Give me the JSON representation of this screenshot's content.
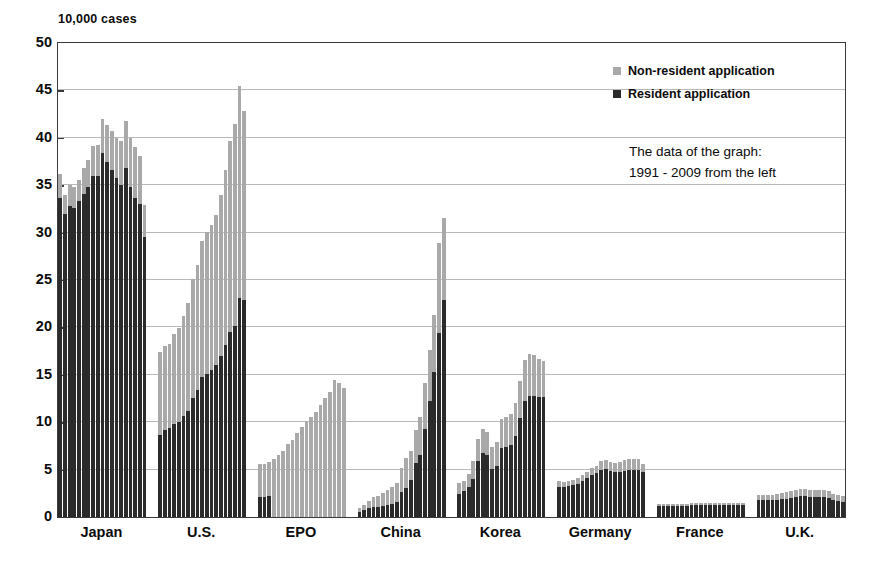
{
  "chart_data": {
    "type": "bar",
    "subtype": "stacked-grouped",
    "title": "",
    "unit_label": "10,000 cases",
    "xlabel": "",
    "ylabel": "",
    "ylim": [
      0,
      50
    ],
    "yticks": [
      0,
      5,
      10,
      15,
      20,
      25,
      30,
      35,
      40,
      45,
      50
    ],
    "grid": true,
    "legend_position": "upper-right-inside",
    "annotation": [
      "The data of the graph:",
      "1991 - 2009 from the left"
    ],
    "years": [
      1991,
      1992,
      1993,
      1994,
      1995,
      1996,
      1997,
      1998,
      1999,
      2000,
      2001,
      2002,
      2003,
      2004,
      2005,
      2006,
      2007,
      2008,
      2009
    ],
    "categories": [
      "Japan",
      "U.S.",
      "EPO",
      "China",
      "Korea",
      "Germany",
      "France",
      "U.K."
    ],
    "series": [
      {
        "name": "Resident application",
        "color": "#2b2b2b"
      },
      {
        "name": "Non-resident application",
        "color": "#a9a9a9"
      }
    ],
    "groups": [
      {
        "category": "Japan",
        "resident": [
          33.6,
          32.0,
          32.8,
          32.6,
          33.3,
          34.1,
          34.8,
          36.0,
          36.0,
          38.4,
          37.4,
          36.6,
          35.8,
          35.0,
          36.8,
          34.8,
          33.6,
          33.0,
          29.5
        ],
        "non_resident": [
          2.6,
          2.0,
          2.2,
          2.2,
          2.3,
          2.7,
          2.9,
          3.1,
          3.2,
          3.6,
          3.9,
          4.1,
          4.2,
          4.7,
          5.0,
          5.2,
          5.4,
          5.1,
          3.4
        ]
      },
      {
        "category": "U.S.",
        "resident": [
          8.7,
          9.2,
          9.4,
          9.8,
          10.0,
          10.7,
          11.2,
          12.6,
          13.4,
          14.8,
          15.1,
          15.5,
          16.0,
          17.0,
          18.1,
          19.5,
          20.1,
          23.1,
          22.9
        ],
        "non_resident": [
          8.7,
          8.8,
          8.9,
          9.5,
          9.9,
          10.5,
          11.4,
          12.5,
          13.2,
          14.3,
          15.0,
          15.3,
          15.9,
          17.0,
          18.5,
          20.2,
          21.4,
          22.4,
          19.9
        ]
      },
      {
        "category": "EPO",
        "resident": [
          2.1,
          2.1,
          2.2,
          0.0,
          0.0,
          0.0,
          0.0,
          0.0,
          0.0,
          0.0,
          0.0,
          0.0,
          0.0,
          0.0,
          0.0,
          0.0,
          0.0,
          0.0,
          0.0
        ],
        "non_resident": [
          3.5,
          3.5,
          3.6,
          6.1,
          6.5,
          7.0,
          7.7,
          8.1,
          8.9,
          9.5,
          10.1,
          10.5,
          11.1,
          11.8,
          12.6,
          13.2,
          14.5,
          14.1,
          13.6
        ]
      },
      {
        "category": "China",
        "resident": [
          0.5,
          0.7,
          0.9,
          1.1,
          1.1,
          1.2,
          1.3,
          1.4,
          1.6,
          2.6,
          3.1,
          3.9,
          5.7,
          6.5,
          9.3,
          12.2,
          15.3,
          19.4,
          22.9
        ],
        "non_resident": [
          0.4,
          0.6,
          0.8,
          1.0,
          1.1,
          1.3,
          1.6,
          1.8,
          2.0,
          2.6,
          3.1,
          3.1,
          3.5,
          4.1,
          4.8,
          5.4,
          6.0,
          9.5,
          8.6
        ]
      },
      {
        "category": "Korea",
        "resident": [
          2.4,
          2.7,
          3.2,
          4.0,
          5.9,
          6.8,
          6.5,
          5.1,
          5.4,
          7.3,
          7.4,
          7.6,
          8.5,
          10.4,
          12.2,
          12.8,
          12.8,
          12.7,
          12.7
        ],
        "non_resident": [
          1.2,
          1.1,
          1.3,
          1.9,
          2.3,
          2.5,
          2.5,
          2.3,
          2.5,
          3.0,
          3.1,
          3.3,
          3.5,
          4.0,
          4.4,
          4.4,
          4.3,
          4.0,
          3.8
        ]
      },
      {
        "category": "Germany",
        "resident": [
          3.2,
          3.2,
          3.3,
          3.4,
          3.5,
          3.8,
          4.1,
          4.4,
          4.6,
          5.0,
          5.1,
          4.9,
          4.8,
          4.8,
          4.9,
          5.0,
          5.0,
          5.0,
          4.7
        ],
        "non_resident": [
          0.6,
          0.5,
          0.5,
          0.5,
          0.6,
          0.6,
          0.7,
          0.8,
          0.8,
          0.9,
          0.9,
          0.9,
          0.9,
          1.0,
          1.1,
          1.1,
          1.1,
          1.1,
          0.9
        ]
      },
      {
        "category": "France",
        "resident": [
          1.2,
          1.2,
          1.2,
          1.2,
          1.2,
          1.2,
          1.2,
          1.3,
          1.3,
          1.3,
          1.3,
          1.3,
          1.3,
          1.3,
          1.3,
          1.3,
          1.3,
          1.3,
          1.3
        ],
        "non_resident": [
          0.2,
          0.2,
          0.2,
          0.2,
          0.2,
          0.2,
          0.2,
          0.2,
          0.2,
          0.2,
          0.2,
          0.2,
          0.2,
          0.2,
          0.2,
          0.2,
          0.2,
          0.2,
          0.2
        ]
      },
      {
        "category": "U.K.",
        "resident": [
          1.8,
          1.8,
          1.8,
          1.8,
          1.8,
          1.9,
          1.9,
          2.0,
          2.1,
          2.2,
          2.2,
          2.1,
          2.1,
          2.1,
          2.1,
          2.0,
          1.8,
          1.7,
          1.6
        ],
        "non_resident": [
          0.5,
          0.5,
          0.5,
          0.5,
          0.6,
          0.6,
          0.7,
          0.7,
          0.8,
          0.8,
          0.8,
          0.7,
          0.7,
          0.7,
          0.7,
          0.7,
          0.6,
          0.6,
          0.6
        ]
      }
    ]
  },
  "legend": {
    "items": [
      {
        "label": "Non-resident application",
        "swatch": "non"
      },
      {
        "label": "Resident application",
        "swatch": "res"
      }
    ]
  },
  "annotation": {
    "line1": "The data of the graph:",
    "line2": "1991 - 2009 from the left"
  },
  "axis": {
    "unit_label": "10,000 cases",
    "y_tick_labels": [
      "50",
      "45",
      "40",
      "35",
      "30",
      "25",
      "20",
      "15",
      "10",
      "5",
      "0"
    ],
    "x_tick_labels": [
      "Japan",
      "U.S.",
      "EPO",
      "China",
      "Korea",
      "Germany",
      "France",
      "U.K."
    ]
  },
  "colors": {
    "resident": "#2b2b2b",
    "non_resident": "#a9a9a9",
    "grid": "#b9b9b9",
    "frame": "#3a3a3a",
    "background": "#ffffff"
  }
}
